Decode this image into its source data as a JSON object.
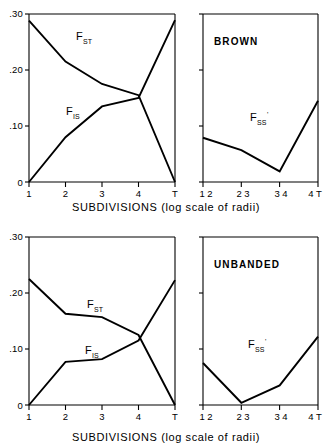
{
  "figure": {
    "x_axis_caption": "SUBDIVISIONS   (log scale of radii)",
    "panel_count": 4
  },
  "chart_data": [
    {
      "id": "top-left",
      "type": "line",
      "title": "",
      "xlabel": "SUBDIVISIONS (log scale of radii)",
      "ylabel": "",
      "ylim": [
        0,
        0.3
      ],
      "xlim": [
        0,
        4
      ],
      "grid": false,
      "legend": "inline-labels",
      "x_tick_labels": [
        "1",
        "2",
        "3",
        "4",
        "T"
      ],
      "y_tick_labels": [
        ".30",
        ".20",
        ".10",
        "0"
      ],
      "y_tick_values": [
        0.3,
        0.2,
        0.1,
        0.0
      ],
      "series": [
        {
          "name": "F_ST",
          "label": "F",
          "label_sub": "ST",
          "x": [
            0,
            1,
            2,
            3,
            4
          ],
          "values": [
            0.288,
            0.215,
            0.175,
            0.155,
            0.0
          ]
        },
        {
          "name": "F_IS",
          "label": "F",
          "label_sub": "IS",
          "x": [
            0,
            1,
            2,
            3,
            4
          ],
          "values": [
            0.0,
            0.08,
            0.135,
            0.15,
            0.289
          ]
        }
      ]
    },
    {
      "id": "top-right",
      "type": "line",
      "title": "BROWN",
      "xlabel": "SUBDIVISIONS (log scale of radii)",
      "ylabel": "",
      "ylim": [
        0,
        0.3
      ],
      "xlim": [
        0,
        3
      ],
      "grid": false,
      "x_tick_labels": [
        "1 2",
        "2 3",
        "3 4",
        "4 T"
      ],
      "y_tick_labels": [
        "",
        "",
        "",
        ""
      ],
      "y_tick_values": [
        0.3,
        0.2,
        0.1,
        0.0
      ],
      "series": [
        {
          "name": "F_SS_prime",
          "label": "F",
          "label_sub": "SS",
          "label_prime": "'",
          "x": [
            0,
            1,
            2,
            3
          ],
          "values": [
            0.079,
            0.057,
            0.019,
            0.145
          ]
        }
      ]
    },
    {
      "id": "bottom-left",
      "type": "line",
      "title": "",
      "xlabel": "SUBDIVISIONS (log scale of radii)",
      "ylabel": "",
      "ylim": [
        0,
        0.3
      ],
      "xlim": [
        0,
        4
      ],
      "grid": false,
      "legend": "inline-labels",
      "x_tick_labels": [
        "1",
        "2",
        "3",
        "4",
        "T"
      ],
      "y_tick_labels": [
        ".30",
        ".20",
        ".10",
        "0"
      ],
      "y_tick_values": [
        0.3,
        0.2,
        0.1,
        0.0
      ],
      "series": [
        {
          "name": "F_ST",
          "label": "F",
          "label_sub": "ST",
          "x": [
            0,
            1,
            2,
            3,
            4
          ],
          "values": [
            0.225,
            0.163,
            0.157,
            0.125,
            0.0
          ]
        },
        {
          "name": "F_IS",
          "label": "F",
          "label_sub": "IS",
          "x": [
            0,
            1,
            2,
            3,
            4
          ],
          "values": [
            0.0,
            0.077,
            0.082,
            0.115,
            0.223
          ]
        }
      ]
    },
    {
      "id": "bottom-right",
      "type": "line",
      "title": "UNBANDED",
      "xlabel": "SUBDIVISIONS (log scale of radii)",
      "ylabel": "",
      "ylim": [
        0,
        0.3
      ],
      "xlim": [
        0,
        3
      ],
      "grid": false,
      "x_tick_labels": [
        "1 2",
        "2 3",
        "3 4",
        "4 T"
      ],
      "y_tick_labels": [
        "",
        "",
        "",
        ""
      ],
      "y_tick_values": [
        0.3,
        0.2,
        0.1,
        0.0
      ],
      "series": [
        {
          "name": "F_SS_prime",
          "label": "F",
          "label_sub": "SS",
          "label_prime": "'",
          "x": [
            0,
            1,
            2,
            3
          ],
          "values": [
            0.075,
            0.004,
            0.035,
            0.122
          ]
        }
      ]
    }
  ],
  "panels": {
    "top_left": {
      "y_labels": [
        ".30",
        ".20",
        ".10",
        "0"
      ],
      "x_labels": [
        "1",
        "2",
        "3",
        "4",
        "T"
      ],
      "curve_label_fst": "F",
      "curve_label_fst_sub": "ST",
      "curve_label_fis": "F",
      "curve_label_fis_sub": "IS"
    },
    "top_right": {
      "title": "BROWN",
      "x_labels": [
        "1 2",
        "2 3",
        "3 4",
        "4 T"
      ],
      "curve_label": "F",
      "curve_label_sub": "SS",
      "curve_label_prime": "'"
    },
    "bottom_left": {
      "y_labels": [
        ".30",
        ".20",
        ".10",
        "0"
      ],
      "x_labels": [
        "1",
        "2",
        "3",
        "4",
        "T"
      ],
      "curve_label_fst": "F",
      "curve_label_fst_sub": "ST",
      "curve_label_fis": "F",
      "curve_label_fis_sub": "IS"
    },
    "bottom_right": {
      "title": "UNBANDED",
      "x_labels": [
        "1 2",
        "2 3",
        "3 4",
        "4 T"
      ],
      "curve_label": "F",
      "curve_label_sub": "SS",
      "curve_label_prime": "'"
    }
  },
  "captions": {
    "top_axis_caption": "SUBDIVISIONS   (log scale of radii)",
    "bottom_axis_caption": "SUBDIVISIONS   (log scale of radii)"
  }
}
